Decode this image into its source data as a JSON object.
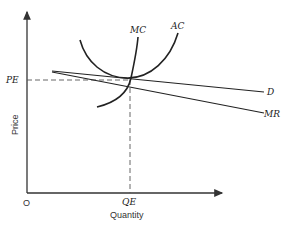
{
  "diagram": {
    "type": "economics-monopolistic-competition-equilibrium",
    "axes": {
      "y_label": "Price",
      "x_label": "Quantity",
      "origin_label": "O"
    },
    "equilibrium": {
      "price_label": "PE",
      "quantity_label": "QE"
    },
    "curves": [
      {
        "id": "AC",
        "label": "AC",
        "kind": "U-shaped average cost curve"
      },
      {
        "id": "MC",
        "label": "MC",
        "kind": "marginal cost curve"
      },
      {
        "id": "D",
        "label": "D",
        "kind": "demand curve (downward sloping)"
      },
      {
        "id": "MR",
        "label": "MR",
        "kind": "marginal revenue curve"
      }
    ],
    "colors": {
      "line": "#222222",
      "dashed": "#555555",
      "background": "#ffffff"
    }
  }
}
